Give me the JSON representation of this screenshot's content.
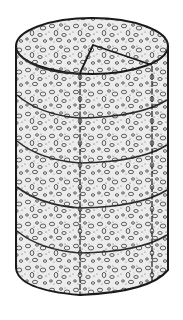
{
  "figure": {
    "shape": "cylinder",
    "texture": "pebble-stipple",
    "colors": {
      "background": "#ffffff",
      "fill": "#ececec",
      "stroke": "#1a1a1a"
    },
    "geometry": {
      "left_x": 16,
      "right_x": 168,
      "top_center_y": 46,
      "top_ry": 28,
      "bottom_y": 295,
      "wedge_apex": [
        93,
        45
      ],
      "wedge_left_vertical_x": 80,
      "wedge_right_vertical_x": 152,
      "band_count": 4,
      "band_left_y": [
        97,
        143,
        189,
        232
      ]
    }
  }
}
